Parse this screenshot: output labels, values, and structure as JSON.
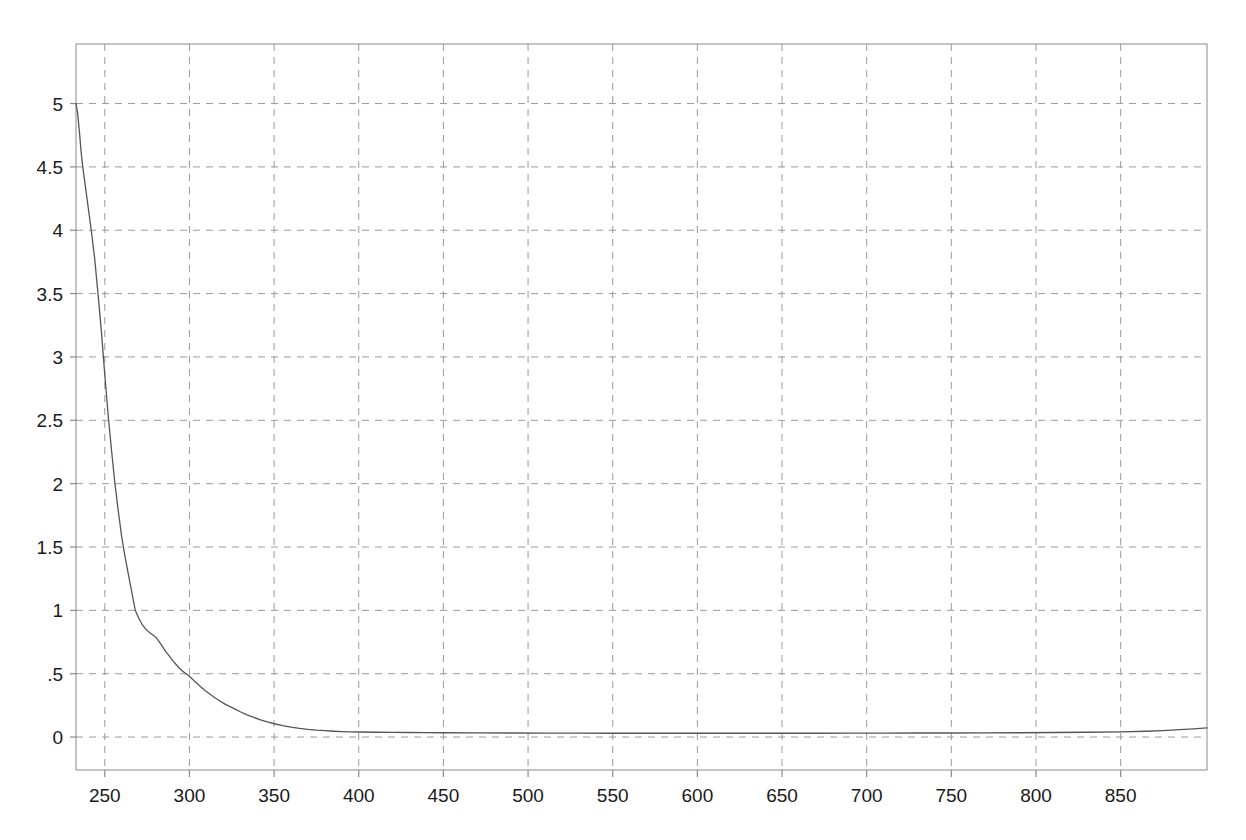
{
  "chart_data": {
    "type": "line",
    "title": "",
    "subtitle": "",
    "xlabel": "",
    "ylabel": "",
    "xlim": [
      233,
      901
    ],
    "ylim": [
      -0.26,
      5.47
    ],
    "grid": true,
    "grid_style": "dashed",
    "legend": "none",
    "x_ticks": [
      250,
      300,
      350,
      400,
      450,
      500,
      550,
      600,
      650,
      700,
      750,
      800,
      850
    ],
    "x_tick_labels": [
      "250",
      "300",
      "350",
      "400",
      "450",
      "500",
      "550",
      "600",
      "650",
      "700",
      "750",
      "800",
      "850"
    ],
    "y_ticks": [
      0,
      0.5,
      1,
      1.5,
      2,
      2.5,
      3,
      3.5,
      4,
      4.5,
      5
    ],
    "y_tick_labels": [
      "0",
      ".5",
      "1",
      "1.5",
      "2",
      "2.5",
      "3",
      "3.5",
      "4",
      "4.5",
      "5"
    ],
    "series": [
      {
        "name": "absorbance",
        "color": "#555555",
        "line_width": 1.3,
        "x": [
          233,
          234,
          235,
          236,
          237,
          238,
          240,
          242,
          244,
          246,
          248,
          250,
          252,
          254,
          256,
          258,
          260,
          262,
          264,
          266,
          268,
          270,
          272,
          274,
          276,
          278,
          280,
          282,
          284,
          286,
          288,
          290,
          292,
          294,
          296,
          298,
          300,
          303,
          306,
          309,
          312,
          315,
          318,
          321,
          324,
          327,
          330,
          334,
          338,
          342,
          346,
          350,
          355,
          360,
          365,
          370,
          375,
          380,
          385,
          390,
          395,
          400,
          410,
          420,
          430,
          440,
          450,
          470,
          490,
          510,
          530,
          550,
          570,
          590,
          610,
          630,
          650,
          670,
          690,
          710,
          730,
          750,
          770,
          790,
          810,
          830,
          850,
          865,
          875,
          885,
          893,
          901
        ],
        "y": [
          5.0,
          4.92,
          4.78,
          4.62,
          4.5,
          4.4,
          4.2,
          4.0,
          3.78,
          3.5,
          3.2,
          2.86,
          2.54,
          2.26,
          2.0,
          1.78,
          1.58,
          1.42,
          1.28,
          1.14,
          1.0,
          0.94,
          0.89,
          0.855,
          0.83,
          0.81,
          0.79,
          0.755,
          0.715,
          0.675,
          0.64,
          0.605,
          0.575,
          0.545,
          0.52,
          0.5,
          0.48,
          0.44,
          0.405,
          0.37,
          0.34,
          0.31,
          0.285,
          0.26,
          0.24,
          0.22,
          0.2,
          0.175,
          0.155,
          0.135,
          0.12,
          0.105,
          0.09,
          0.078,
          0.068,
          0.06,
          0.054,
          0.05,
          0.046,
          0.043,
          0.041,
          0.04,
          0.038,
          0.037,
          0.036,
          0.035,
          0.034,
          0.033,
          0.032,
          0.031,
          0.031,
          0.03,
          0.03,
          0.03,
          0.03,
          0.03,
          0.03,
          0.03,
          0.031,
          0.031,
          0.032,
          0.032,
          0.033,
          0.034,
          0.036,
          0.038,
          0.041,
          0.046,
          0.051,
          0.058,
          0.064,
          0.072
        ]
      }
    ],
    "axes_color": "#8a8a8a",
    "grid_color": "#9a9a9a",
    "background_color": "#ffffff"
  },
  "plot_box": {
    "left": 76,
    "right": 1207,
    "top": 44,
    "bottom": 770
  }
}
